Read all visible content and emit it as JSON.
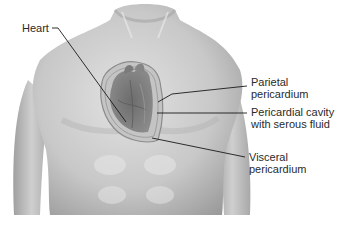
{
  "diagram": {
    "labels": [
      {
        "id": "heart",
        "text": "Heart"
      },
      {
        "id": "parietal",
        "line1": "Parietal",
        "line2": "pericardium"
      },
      {
        "id": "cavity",
        "line1": "Pericardial cavity",
        "line2": "with serous fluid"
      },
      {
        "id": "visceral",
        "line1": "Visceral",
        "line2": "pericardium"
      }
    ],
    "colors": {
      "skin_light": "#d6d6d6",
      "skin_mid": "#b5b5b5",
      "skin_dark": "#8a8a8a",
      "heart": "#7d7d7d",
      "pericardium_fill": "#bdbdbd",
      "leader_line": "#1a1a1a",
      "text": "#2a2a2a"
    }
  }
}
